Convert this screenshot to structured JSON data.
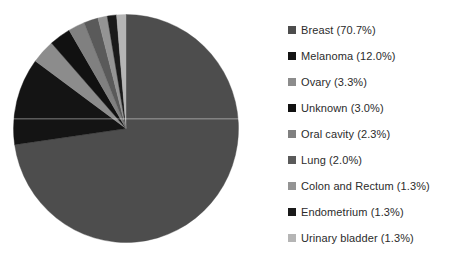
{
  "chart_data": {
    "type": "pie",
    "title": "",
    "xlabel": "",
    "ylabel": "",
    "legend_position": "right",
    "grid": false,
    "start_angle_deg": 0,
    "direction": "clockwise",
    "categories": [
      "Breast",
      "Melanoma",
      "Ovary",
      "Unknown",
      "Oral cavity",
      "Lung",
      "Colon and Rectum",
      "Endometrium",
      "Urinary bladder"
    ],
    "values": [
      70.7,
      12.0,
      3.3,
      3.0,
      2.3,
      2.0,
      1.3,
      1.3,
      1.3
    ],
    "value_unit": "%",
    "colors": [
      "#4d4d4d",
      "#141414",
      "#8c8c8c",
      "#111111",
      "#808080",
      "#5a5a5a",
      "#949494",
      "#1a1a1a",
      "#b5b5b5"
    ],
    "slices": [
      {
        "label": "Breast",
        "value": 70.7,
        "display": "Breast (70.7%)",
        "color": "#4d4d4d"
      },
      {
        "label": "Melanoma",
        "value": 12.0,
        "display": "Melanoma (12.0%)",
        "color": "#141414"
      },
      {
        "label": "Ovary",
        "value": 3.3,
        "display": "Ovary (3.3%)",
        "color": "#8c8c8c"
      },
      {
        "label": "Unknown",
        "value": 3.0,
        "display": "Unknown (3.0%)",
        "color": "#111111"
      },
      {
        "label": "Oral cavity",
        "value": 2.3,
        "display": "Oral cavity (2.3%)",
        "color": "#808080"
      },
      {
        "label": "Lung",
        "value": 2.0,
        "display": "Lung (2.0%)",
        "color": "#5a5a5a"
      },
      {
        "label": "Colon and Rectum",
        "value": 1.3,
        "display": "Colon and Rectum (1.3%)",
        "color": "#949494"
      },
      {
        "label": "Endometrium",
        "value": 1.3,
        "display": "Endometrium (1.3%)",
        "color": "#1a1a1a"
      },
      {
        "label": "Urinary bladder",
        "value": 1.3,
        "display": "Urinary bladder (1.3%)",
        "color": "#b5b5b5"
      }
    ]
  },
  "legend": {
    "items": [
      {
        "label": "Breast (70.7%)",
        "color": "#4d4d4d"
      },
      {
        "label": "Melanoma (12.0%)",
        "color": "#141414"
      },
      {
        "label": "Ovary (3.3%)",
        "color": "#8c8c8c"
      },
      {
        "label": "Unknown (3.0%)",
        "color": "#111111"
      },
      {
        "label": "Oral cavity (2.3%)",
        "color": "#808080"
      },
      {
        "label": "Lung (2.0%)",
        "color": "#5a5a5a"
      },
      {
        "label": "Colon and Rectum (1.3%)",
        "color": "#949494"
      },
      {
        "label": "Endometrium (1.3%)",
        "color": "#1a1a1a"
      },
      {
        "label": "Urinary bladder (1.3%)",
        "color": "#b5b5b5"
      }
    ]
  },
  "canvas": {
    "background": "#ffffff",
    "text_color": "#2b2b2b"
  }
}
